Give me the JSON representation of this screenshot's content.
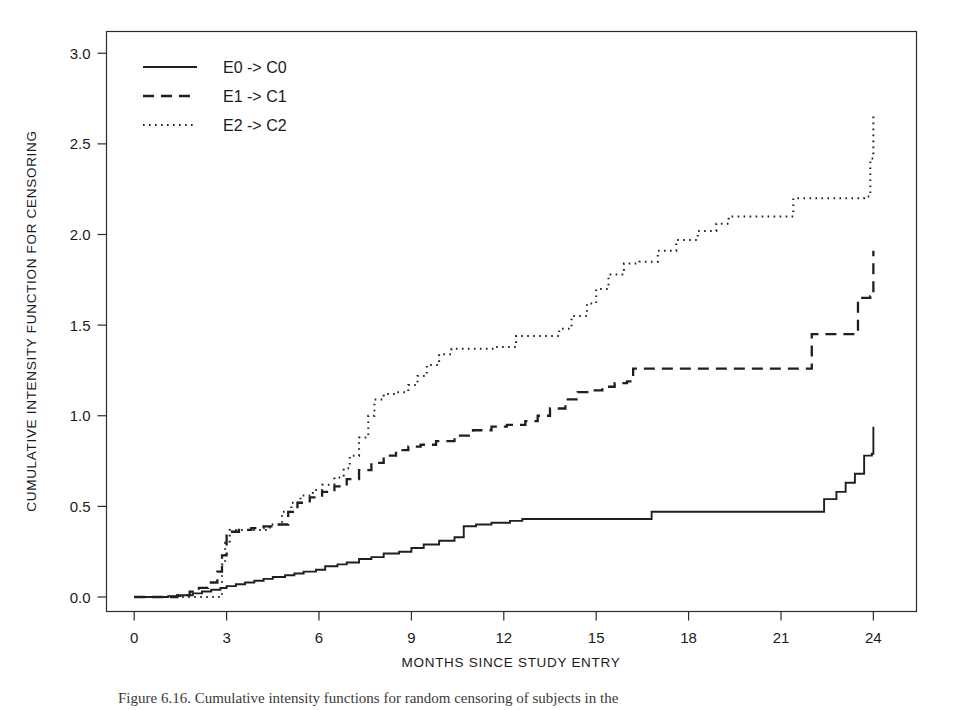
{
  "figure": {
    "caption": "Figure 6.16. Cumulative intensity functions for random censoring of subjects in the",
    "background_color": "#ffffff",
    "line_color": "#1f1f1f"
  },
  "legend": {
    "position": "top-left-inside",
    "entries": [
      {
        "label": "E0 -> C0",
        "style": "solid"
      },
      {
        "label": "E1 -> C1",
        "style": "dashed"
      },
      {
        "label": "E2 -> C2",
        "style": "dotted"
      }
    ]
  },
  "chart_data": {
    "type": "line",
    "title": "",
    "subtitle": "",
    "xlabel": "MONTHS SINCE STUDY ENTRY",
    "ylabel": "CUMULATIVE INTENSITY FUNCTION FOR CENSORING",
    "xlim": [
      -0.9,
      25.4
    ],
    "ylim": [
      -0.08,
      3.12
    ],
    "xticks": [
      0,
      3,
      6,
      9,
      12,
      15,
      18,
      21,
      24
    ],
    "xticklabels": [
      "0",
      "3",
      "6",
      "9",
      "12",
      "15",
      "18",
      "21",
      "24"
    ],
    "yticks": [
      0.0,
      0.5,
      1.0,
      1.5,
      2.0,
      2.5,
      3.0
    ],
    "yticklabels": [
      "0.0",
      "0.5",
      "1.0",
      "1.5",
      "2.0",
      "2.5",
      "3.0"
    ],
    "grid": false,
    "step_type": "post",
    "series": [
      {
        "name": "E0 -> C0",
        "style": "solid",
        "x": [
          0.0,
          0.6,
          1.1,
          1.5,
          1.9,
          2.2,
          2.5,
          2.8,
          3.0,
          3.3,
          3.6,
          3.9,
          4.2,
          4.5,
          4.9,
          5.2,
          5.5,
          5.9,
          6.2,
          6.6,
          6.9,
          7.3,
          7.7,
          8.1,
          8.6,
          9.0,
          9.4,
          9.9,
          10.4,
          10.7,
          11.1,
          11.6,
          12.2,
          12.6,
          16.8,
          21.9,
          22.4,
          22.8,
          23.1,
          23.4,
          23.7,
          23.95,
          24.0
        ],
        "y": [
          0.0,
          0.0,
          0.005,
          0.01,
          0.02,
          0.03,
          0.04,
          0.05,
          0.06,
          0.07,
          0.08,
          0.09,
          0.1,
          0.11,
          0.12,
          0.13,
          0.14,
          0.15,
          0.17,
          0.18,
          0.19,
          0.21,
          0.22,
          0.24,
          0.25,
          0.27,
          0.29,
          0.31,
          0.33,
          0.39,
          0.4,
          0.41,
          0.42,
          0.43,
          0.47,
          0.47,
          0.54,
          0.58,
          0.63,
          0.68,
          0.78,
          0.79,
          0.94
        ]
      },
      {
        "name": "E1 -> C1",
        "style": "dashed",
        "x": [
          0.0,
          0.9,
          1.4,
          1.8,
          2.1,
          2.4,
          2.7,
          2.85,
          3.0,
          3.4,
          3.8,
          4.2,
          4.7,
          5.0,
          5.3,
          5.7,
          6.1,
          6.5,
          6.9,
          7.3,
          7.7,
          8.1,
          8.5,
          8.9,
          9.3,
          9.8,
          10.4,
          11.0,
          11.6,
          12.1,
          12.7,
          13.1,
          13.5,
          14.0,
          14.4,
          14.9,
          15.2,
          15.6,
          16.0,
          16.2,
          21.3,
          22.0,
          22.9,
          23.5,
          23.9,
          24.0
        ],
        "y": [
          0.0,
          0.0,
          0.01,
          0.03,
          0.05,
          0.08,
          0.14,
          0.23,
          0.36,
          0.37,
          0.38,
          0.39,
          0.4,
          0.47,
          0.52,
          0.55,
          0.58,
          0.61,
          0.65,
          0.7,
          0.74,
          0.78,
          0.81,
          0.83,
          0.84,
          0.86,
          0.89,
          0.92,
          0.94,
          0.95,
          0.97,
          1.0,
          1.04,
          1.09,
          1.13,
          1.14,
          1.16,
          1.18,
          1.19,
          1.26,
          1.26,
          1.45,
          1.45,
          1.65,
          1.66,
          1.91
        ]
      },
      {
        "name": "E2 -> C2",
        "style": "dotted",
        "x": [
          0.0,
          1.0,
          1.7,
          2.3,
          2.7,
          2.85,
          2.95,
          3.1,
          3.6,
          4.0,
          4.4,
          4.8,
          5.1,
          5.4,
          5.8,
          6.1,
          6.5,
          6.8,
          7.0,
          7.3,
          7.6,
          7.8,
          8.1,
          8.5,
          8.9,
          9.2,
          9.5,
          9.9,
          10.3,
          11.0,
          11.7,
          12.4,
          12.9,
          13.3,
          13.8,
          14.2,
          14.7,
          15.0,
          15.4,
          15.9,
          16.4,
          17.0,
          17.6,
          18.3,
          18.9,
          19.3,
          20.0,
          21.0,
          21.4,
          21.8,
          22.6,
          23.2,
          23.7,
          23.9,
          24.0
        ],
        "y": [
          0.0,
          0.0,
          0.0,
          0.0,
          0.0,
          0.18,
          0.3,
          0.37,
          0.37,
          0.37,
          0.4,
          0.47,
          0.52,
          0.56,
          0.59,
          0.62,
          0.66,
          0.71,
          0.78,
          0.88,
          1.0,
          1.09,
          1.12,
          1.13,
          1.17,
          1.22,
          1.28,
          1.34,
          1.37,
          1.37,
          1.38,
          1.44,
          1.44,
          1.44,
          1.48,
          1.55,
          1.62,
          1.7,
          1.78,
          1.84,
          1.85,
          1.91,
          1.97,
          2.02,
          2.06,
          2.1,
          2.1,
          2.1,
          2.2,
          2.2,
          2.2,
          2.2,
          2.21,
          2.42,
          2.67
        ]
      }
    ]
  }
}
